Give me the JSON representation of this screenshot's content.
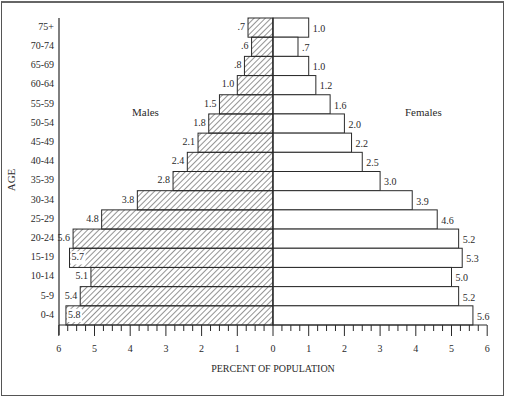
{
  "chart_data": {
    "type": "bar",
    "subtype": "population-pyramid",
    "title": "",
    "xlabel": "PERCENT OF POPULATION",
    "ylabel": "AGE",
    "xlim": [
      -6,
      6
    ],
    "x_ticks_left": [
      "6",
      "5",
      "4",
      "3",
      "2",
      "1",
      "0"
    ],
    "x_ticks_right": [
      "1",
      "2",
      "3",
      "4",
      "5",
      "6"
    ],
    "grid": false,
    "legend": [
      {
        "name": "Males",
        "style": "hatched",
        "side": "left"
      },
      {
        "name": "Females",
        "style": "open",
        "side": "right"
      }
    ],
    "categories": [
      "75+",
      "70-74",
      "65-69",
      "60-64",
      "55-59",
      "50-54",
      "45-49",
      "40-44",
      "35-39",
      "30-34",
      "25-29",
      "20-24",
      "15-19",
      "10-14",
      "5-9",
      "0-4"
    ],
    "series": [
      {
        "name": "Males",
        "values": [
          0.7,
          0.6,
          0.8,
          1.0,
          1.5,
          1.8,
          2.1,
          2.4,
          2.8,
          3.8,
          4.8,
          5.6,
          5.7,
          5.1,
          5.4,
          5.8
        ],
        "labels": [
          ".7",
          ".6",
          ".8",
          "1.0",
          "1.5",
          "1.8",
          "2.1",
          "2.4",
          "2.8",
          "3.8",
          "4.8",
          "5.6",
          "5.7",
          "5.1",
          "5.4",
          "5.8"
        ]
      },
      {
        "name": "Females",
        "values": [
          1.0,
          0.7,
          1.0,
          1.2,
          1.6,
          2.0,
          2.2,
          2.5,
          3.0,
          3.9,
          4.6,
          5.2,
          5.3,
          5.0,
          5.2,
          5.6
        ],
        "labels": [
          "1.0",
          ".7",
          "1.0",
          "1.2",
          "1.6",
          "2.0",
          "2.2",
          "2.5",
          "3.0",
          "3.9",
          "4.6",
          "5.2",
          "5.3",
          "5.0",
          "5.2",
          "5.6"
        ]
      }
    ]
  },
  "labels": {
    "males": "Males",
    "females": "Females",
    "age_axis": "AGE",
    "x_axis": "PERCENT OF POPULATION"
  },
  "colors": {
    "ink": "#2a2a2a",
    "background": "#ffffff"
  }
}
